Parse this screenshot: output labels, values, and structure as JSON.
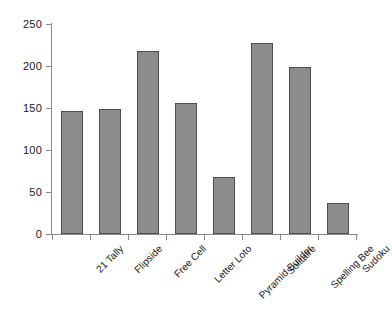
{
  "chart_data": {
    "type": "bar",
    "title": "",
    "subtitle": "",
    "xlabel": "",
    "ylabel": "",
    "ylim": [
      0,
      250
    ],
    "yticks": [
      0,
      50,
      100,
      150,
      200,
      250
    ],
    "ytick_labels": [
      "0",
      "50",
      "100",
      "150",
      "200",
      "250"
    ],
    "grid": false,
    "legend": false,
    "legend_position": "none",
    "categories": [
      "21 Tally",
      "Flipside",
      "Free Cell",
      "Letter Loto",
      "Pyramid Builder",
      "Solitaire",
      "Spelling Bee",
      "Sudoku"
    ],
    "values": [
      147,
      149,
      218,
      156,
      68,
      227,
      199,
      37
    ],
    "series": [
      {
        "name": "",
        "values": [
          147,
          149,
          218,
          156,
          68,
          227,
          199,
          37
        ]
      }
    ],
    "colors": {
      "bar_fill": "#8c8c8c",
      "bar_border": "#4d4d4d",
      "axis": "#8a8a8a",
      "text": "#1a1a1a",
      "background": "#ffffff"
    }
  }
}
